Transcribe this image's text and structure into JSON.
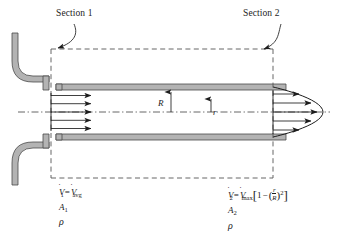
{
  "figure": {
    "type": "fluid-flow-control-volume-diagram",
    "background_color": "#ffffff",
    "line_color": "#1d1d1d",
    "pipe_fill_color": "#b3b3b3",
    "pipe_edge_color": "#4a4a4a"
  },
  "annotations": {
    "section1_label": "Section 1",
    "section2_label": "Section 2",
    "radius_outer_label": "R",
    "radius_inner_label": "r"
  },
  "inlet": {
    "profile": "uniform",
    "arrow_count": 5,
    "equations": {
      "flow_rate_symbol": "V",
      "flow_rate_subscript": "1",
      "equals": "=",
      "flow_rate_value_symbol": "V",
      "flow_rate_value_subscript": "avg",
      "area_symbol": "A",
      "area_subscript": "1",
      "density_symbol": "ρ"
    }
  },
  "outlet": {
    "profile": "parabolic",
    "arrow_count": 5,
    "equations": {
      "flow_rate_symbol": "V",
      "flow_rate_subscript": "2",
      "equals": "=",
      "flow_rate_value_symbol": "V",
      "flow_rate_value_subscript": "max",
      "bracket_open": "[",
      "one": "1",
      "minus": "−",
      "paren_open": "(",
      "numerator": "r",
      "denominator": "R",
      "paren_close": ")",
      "exponent": "2",
      "bracket_close": "]",
      "area_symbol": "A",
      "area_subscript": "2",
      "density_symbol": "ρ"
    }
  },
  "control_volume": {
    "style": "dashed",
    "left_boundary_x": 51,
    "right_boundary_x": 273
  },
  "centerline": {
    "style": "dash-dot"
  }
}
